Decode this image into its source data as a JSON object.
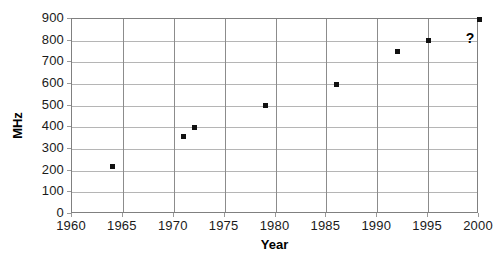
{
  "chart_data": {
    "type": "scatter",
    "title": "",
    "xlabel": "Year",
    "ylabel": "MHz",
    "xlim": [
      1960,
      2000
    ],
    "ylim": [
      0,
      900
    ],
    "xticks": [
      1960,
      1965,
      1970,
      1975,
      1980,
      1985,
      1990,
      1995,
      2000
    ],
    "yticks": [
      0,
      100,
      200,
      300,
      400,
      500,
      600,
      700,
      800,
      900
    ],
    "grid": true,
    "legend": false,
    "marker_color": "#111111",
    "gridline_color": "#b5b5b5",
    "axis_color": "#808080",
    "x": [
      1964,
      1971,
      1972,
      1979,
      1986,
      1992,
      1995,
      2000
    ],
    "y": [
      220,
      360,
      400,
      500,
      600,
      750,
      800,
      900
    ],
    "points": [
      {
        "x": 1964,
        "y": 220
      },
      {
        "x": 1971,
        "y": 360
      },
      {
        "x": 1972,
        "y": 400
      },
      {
        "x": 1979,
        "y": 500
      },
      {
        "x": 1986,
        "y": 600
      },
      {
        "x": 1992,
        "y": 750
      },
      {
        "x": 1995,
        "y": 800
      },
      {
        "x": 2000,
        "y": 900
      }
    ],
    "annotations": [
      {
        "text": "?",
        "x": 1998.7,
        "y": 845
      }
    ]
  }
}
